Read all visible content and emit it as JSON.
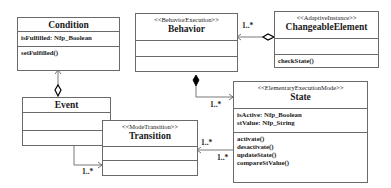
{
  "classes": {
    "condition": {
      "name": "Condition",
      "attributes": [
        "isFulfilled: Nfp_Boolean"
      ],
      "operations": [
        "setFulfilled()"
      ]
    },
    "behavior": {
      "stereotype": "<<BehaviorExecution>>",
      "name": "Behavior",
      "attributes": [],
      "operations": []
    },
    "changeable": {
      "stereotype": "<<AdaptiveInstance>>",
      "name": "ChangeableElement",
      "attributes": [],
      "operations": [
        "checkState()"
      ]
    },
    "event": {
      "name": "Event",
      "attributes": [],
      "operations": []
    },
    "transition": {
      "stereotype": "<<ModeTransition>>",
      "name": "Transition",
      "attributes": [],
      "operations": []
    },
    "state": {
      "stereotype": "<<ElementaryExecutionMode>>",
      "name": "State",
      "attributes": [
        "isActive: Nfp_Boolean",
        "stValue: Nfp_String"
      ],
      "operations": [
        "activate()",
        "desactivate()",
        "updateState()",
        "compareStValue()"
      ]
    }
  },
  "associations": [
    {
      "from": "ChangeableElement",
      "to": "Behavior",
      "kind": "aggregation",
      "multiplicity": "1..*"
    },
    {
      "from": "Behavior",
      "to": "State",
      "kind": "composition",
      "multiplicity": "1..*"
    },
    {
      "from": "Event",
      "to": "Condition",
      "kind": "aggregation",
      "multiplicity": ""
    },
    {
      "from": "Event",
      "to": "Transition",
      "kind": "association",
      "multiplicity": "1..*"
    },
    {
      "from": "State",
      "to": "Transition",
      "kind": "association",
      "multiplicity_source": "1..*",
      "multiplicity_target": "1..*"
    }
  ],
  "labels": {
    "m_change_behavior": "1..*",
    "m_behavior_state": "1..*",
    "m_event_transition": "1..*",
    "m_state_transition_top": "1..*",
    "m_state_transition_bottom": "1..*"
  }
}
